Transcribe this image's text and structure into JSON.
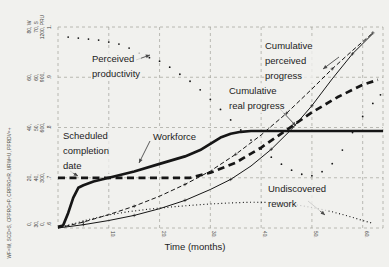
{
  "colors": {
    "ink": "#161616",
    "grid": "#9b9b93",
    "paper": "#f1f1ee",
    "arrow": "#4a4a4a",
    "text": "#1c1c1c"
  },
  "left_legend": "WF=W, SCD=S, CPPRG=P, CRPRG=R, URW=U, PPRDV=+",
  "chart_data": {
    "type": "line",
    "title": "",
    "xlabel": "Time (months)",
    "grid": true,
    "x_axis": {
      "min": 0,
      "max": 64,
      "tick_values": [
        10,
        20,
        30,
        40,
        50,
        60
      ],
      "ticks": [
        "10.",
        "20.",
        "30.",
        "40.",
        "50.",
        "60."
      ],
      "grid_months": [
        0,
        10,
        20,
        30,
        40,
        50,
        60,
        64
      ]
    },
    "scales": [
      {
        "symbol": "W",
        "variable": "Workforce (people)",
        "min": 0,
        "max": 80,
        "labels": [
          "80, W",
          "60,",
          "40,",
          "20,",
          "0,"
        ]
      },
      {
        "symbol": "S",
        "variable": "Scheduled completion date (months)",
        "min": 30,
        "max": 70,
        "labels": [
          "70, S",
          "60,",
          "50,",
          "40,",
          "30,"
        ]
      },
      {
        "symbol": "PRU",
        "variable": "Progress / rework (tasks)",
        "min": 0,
        "max": 1200,
        "labels": [
          "1200, PRU",
          "900,",
          "600,",
          "300,",
          "0,"
        ]
      },
      {
        "symbol": "+",
        "variable": "Perceived productivity (tasks/person-day)",
        "min": 0.6,
        "max": 1.0,
        "labels": [
          "1.",
          ".9",
          ".8",
          ".7",
          ".6"
        ]
      }
    ],
    "series": [
      {
        "name": "Workforce",
        "scale": 0,
        "style": "thick-solid",
        "points": [
          [
            0,
            0.5
          ],
          [
            1,
            1
          ],
          [
            2,
            6
          ],
          [
            3,
            12
          ],
          [
            4,
            16
          ],
          [
            5,
            17
          ],
          [
            7,
            18.5
          ],
          [
            10,
            20
          ],
          [
            15,
            22.5
          ],
          [
            20,
            25.5
          ],
          [
            25,
            28.5
          ],
          [
            28,
            31
          ],
          [
            30,
            33.5
          ],
          [
            32,
            36
          ],
          [
            34,
            37.5
          ],
          [
            36,
            38.3
          ],
          [
            38,
            38.6
          ],
          [
            64,
            38.6
          ]
        ]
      },
      {
        "name": "Scheduled completion date",
        "scale": 1,
        "style": "thick-dashed",
        "points": [
          [
            0,
            40
          ],
          [
            26,
            40
          ],
          [
            30,
            41
          ],
          [
            35,
            43
          ],
          [
            40,
            46
          ],
          [
            45,
            49.5
          ],
          [
            50,
            53
          ],
          [
            55,
            56
          ],
          [
            60,
            58.5
          ],
          [
            63,
            59.5
          ]
        ]
      },
      {
        "name": "Cumulative perceived progress",
        "scale": 2,
        "style": "thin-dashed",
        "points": [
          [
            0,
            0
          ],
          [
            5,
            35
          ],
          [
            10,
            80
          ],
          [
            15,
            130
          ],
          [
            20,
            190
          ],
          [
            25,
            260
          ],
          [
            30,
            340
          ],
          [
            35,
            440
          ],
          [
            40,
            555
          ],
          [
            45,
            685
          ],
          [
            50,
            830
          ],
          [
            54,
            950
          ],
          [
            58,
            1060
          ],
          [
            62,
            1165
          ]
        ]
      },
      {
        "name": "Cumulative real progress",
        "scale": 2,
        "style": "thin-solid",
        "points": [
          [
            0,
            0
          ],
          [
            5,
            20
          ],
          [
            10,
            45
          ],
          [
            15,
            75
          ],
          [
            20,
            115
          ],
          [
            25,
            165
          ],
          [
            30,
            230
          ],
          [
            34,
            290
          ],
          [
            38,
            370
          ],
          [
            42,
            470
          ],
          [
            46,
            590
          ],
          [
            50,
            730
          ],
          [
            54,
            890
          ],
          [
            58,
            1040
          ],
          [
            62,
            1160
          ]
        ]
      },
      {
        "name": "Undiscovered rework",
        "scale": 2,
        "style": "dotted",
        "points": [
          [
            0,
            0
          ],
          [
            3,
            25
          ],
          [
            6,
            50
          ],
          [
            10,
            78
          ],
          [
            14,
            98
          ],
          [
            18,
            113
          ],
          [
            22,
            125
          ],
          [
            26,
            135
          ],
          [
            30,
            143
          ],
          [
            34,
            150
          ],
          [
            38,
            154
          ],
          [
            42,
            152
          ],
          [
            45,
            145
          ],
          [
            48,
            133
          ],
          [
            51,
            117
          ],
          [
            54,
            97
          ],
          [
            57,
            72
          ],
          [
            60,
            45
          ],
          [
            62,
            28
          ]
        ]
      },
      {
        "name": "Perceived productivity",
        "scale": 3,
        "style": "plus-markers",
        "points": [
          [
            2,
            0.98
          ],
          [
            4,
            0.978
          ],
          [
            6,
            0.976
          ],
          [
            8,
            0.974
          ],
          [
            10,
            0.97
          ],
          [
            12,
            0.966
          ],
          [
            14,
            0.958
          ],
          [
            16,
            0.948
          ],
          [
            18,
            0.939
          ],
          [
            20,
            0.932
          ],
          [
            22,
            0.92
          ],
          [
            24,
            0.906
          ],
          [
            26,
            0.892
          ],
          [
            28,
            0.875
          ],
          [
            30,
            0.856
          ],
          [
            32,
            0.836
          ],
          [
            34,
            0.815
          ],
          [
            36,
            0.795
          ],
          [
            38,
            0.775
          ],
          [
            40,
            0.757
          ],
          [
            42,
            0.741
          ],
          [
            44,
            0.727
          ],
          [
            46,
            0.715
          ],
          [
            48,
            0.707
          ],
          [
            50,
            0.704
          ],
          [
            52,
            0.712
          ],
          [
            54,
            0.728
          ],
          [
            56,
            0.755
          ],
          [
            58,
            0.79
          ],
          [
            60,
            0.822
          ],
          [
            62,
            0.848
          ],
          [
            63.5,
            0.865
          ]
        ]
      }
    ],
    "annotations": [
      {
        "id": "perceived-productivity",
        "lines": [
          "Perceived",
          "productivity"
        ],
        "x": 91,
        "y": 51,
        "arrow": [
          136,
          60,
          150,
          55
        ]
      },
      {
        "id": "cumulative-perceived-progress",
        "lines": [
          "Cumulative",
          "perceived",
          "progress"
        ],
        "x": 264,
        "y": 38,
        "arrow": [
          339,
          57,
          323,
          69
        ]
      },
      {
        "id": "cumulative-real-progress",
        "lines": [
          "Cumulative",
          "real progress"
        ],
        "x": 228,
        "y": 83,
        "arrow": [
          280,
          109,
          296,
          126
        ]
      },
      {
        "id": "workforce",
        "lines": [
          "Workforce"
        ],
        "x": 152,
        "y": 129,
        "arrow": [
          150,
          141,
          139,
          163
        ]
      },
      {
        "id": "scheduled-completion-date",
        "lines": [
          "Scheduled",
          "completion",
          "date"
        ],
        "x": 62,
        "y": 128,
        "arrow": [
          70,
          171,
          78,
          176
        ]
      },
      {
        "id": "undiscovered-rework",
        "lines": [
          "Undiscovered",
          "rework"
        ],
        "x": 267,
        "y": 181,
        "arrow": [
          308,
          201,
          325,
          215
        ]
      }
    ]
  }
}
